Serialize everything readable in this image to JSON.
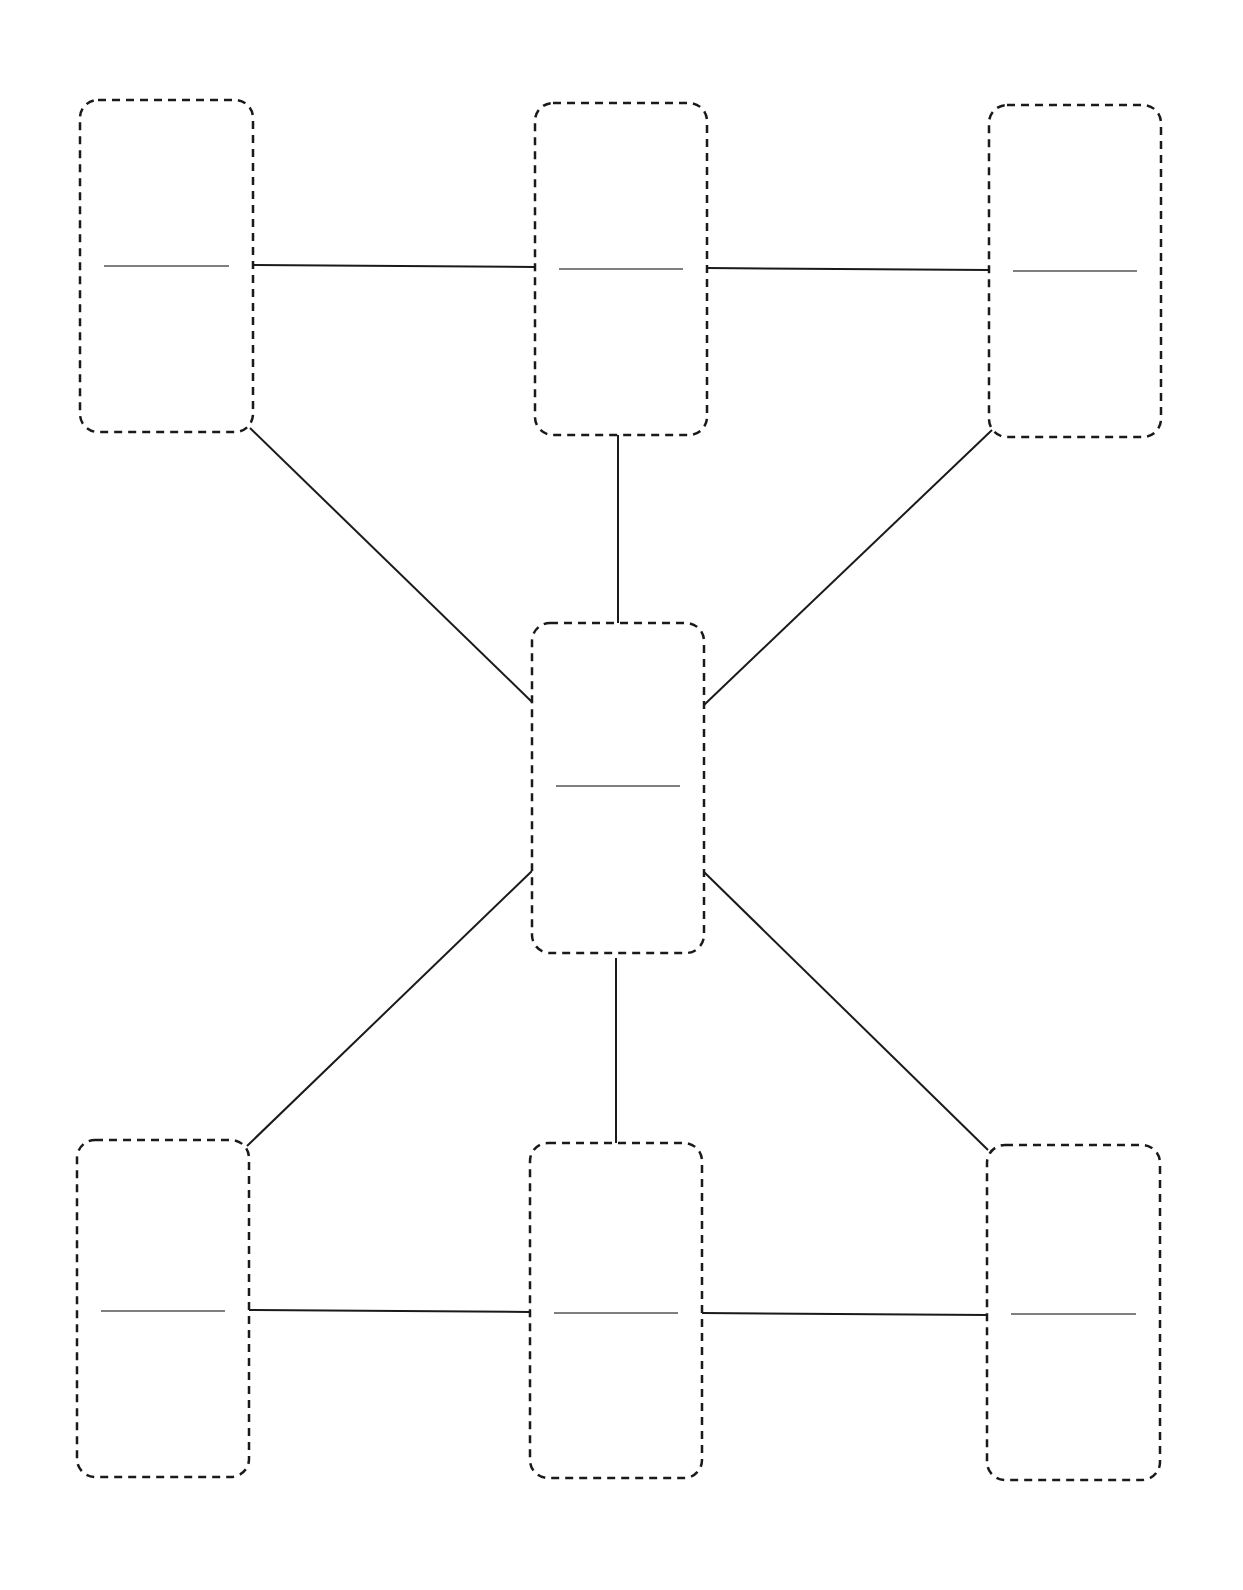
{
  "diagram": {
    "type": "blank-graphic-organizer",
    "background": "#ffffff",
    "stroke_color": "#1a1a1a",
    "nodes": [
      {
        "id": "top-left",
        "x": 80,
        "y": 100,
        "w": 173,
        "h": 332,
        "line_y": 266
      },
      {
        "id": "top-center",
        "x": 535,
        "y": 103,
        "w": 172,
        "h": 332,
        "line_y": 269
      },
      {
        "id": "top-right",
        "x": 989,
        "y": 105,
        "w": 172,
        "h": 332,
        "line_y": 271
      },
      {
        "id": "center",
        "x": 532,
        "y": 623,
        "w": 172,
        "h": 330,
        "line_y": 786
      },
      {
        "id": "bottom-left",
        "x": 77,
        "y": 1140,
        "w": 172,
        "h": 337,
        "line_y": 1311
      },
      {
        "id": "bottom-center",
        "x": 530,
        "y": 1143,
        "w": 172,
        "h": 335,
        "line_y": 1313
      },
      {
        "id": "bottom-right",
        "x": 987,
        "y": 1145,
        "w": 173,
        "h": 335,
        "line_y": 1314
      }
    ],
    "edges": [
      {
        "from": "top-left",
        "to": "top-center",
        "x1": 253,
        "y1": 265,
        "x2": 535,
        "y2": 267
      },
      {
        "from": "top-center",
        "to": "top-right",
        "x1": 707,
        "y1": 268,
        "x2": 989,
        "y2": 270
      },
      {
        "from": "top-left",
        "to": "center",
        "x1": 250,
        "y1": 428,
        "x2": 533,
        "y2": 703
      },
      {
        "from": "top-center",
        "to": "center",
        "x1": 618,
        "y1": 435,
        "x2": 618,
        "y2": 623
      },
      {
        "from": "top-right",
        "to": "center",
        "x1": 992,
        "y1": 430,
        "x2": 704,
        "y2": 705
      },
      {
        "from": "center",
        "to": "bottom-left",
        "x1": 533,
        "y1": 870,
        "x2": 247,
        "y2": 1146
      },
      {
        "from": "center",
        "to": "bottom-center",
        "x1": 616,
        "y1": 958,
        "x2": 616,
        "y2": 1145
      },
      {
        "from": "center",
        "to": "bottom-right",
        "x1": 704,
        "y1": 872,
        "x2": 988,
        "y2": 1150
      },
      {
        "from": "bottom-left",
        "to": "bottom-center",
        "x1": 249,
        "y1": 1310,
        "x2": 530,
        "y2": 1312
      },
      {
        "from": "bottom-center",
        "to": "bottom-right",
        "x1": 702,
        "y1": 1313,
        "x2": 987,
        "y2": 1315
      }
    ]
  }
}
